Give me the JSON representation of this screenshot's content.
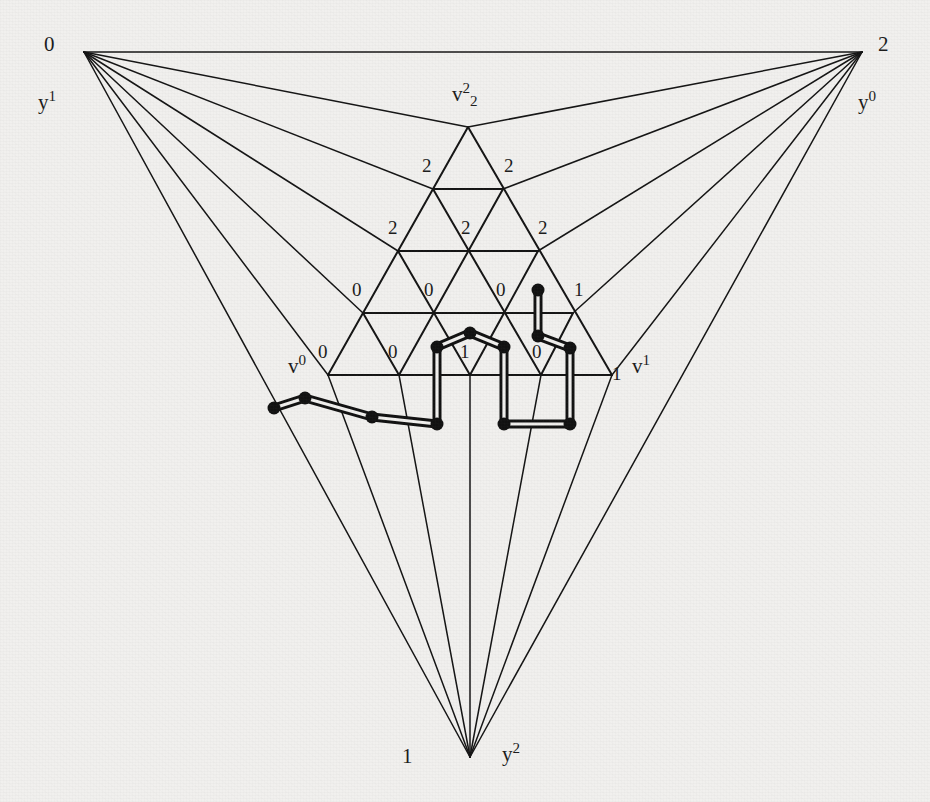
{
  "figure": {
    "background_color": "#f1f0ee",
    "ink_color": "#131313",
    "canvas": {
      "width": 930,
      "height": 802
    }
  },
  "outer_triangle": {
    "description": "Large outer triangle whose three corners fan out to the inner subdivided triangle",
    "corners": [
      {
        "id": "top-left",
        "label": "0",
        "name": "y",
        "name_sup": "1",
        "x": 84,
        "y": 52
      },
      {
        "id": "top-right",
        "label": "2",
        "name": "y",
        "name_sup": "0",
        "x": 862,
        "y": 52
      },
      {
        "id": "bottom",
        "label": "1",
        "name": "y",
        "name_sup": "2",
        "x": 470,
        "y": 757
      }
    ]
  },
  "inner_triangle": {
    "subdivision_level": 4,
    "apex": {
      "name": "v",
      "sup": "2",
      "sub": "2",
      "x": 468,
      "y": 127
    },
    "base_left": {
      "name": "v",
      "sup": "0",
      "x": 328,
      "y": 375
    },
    "base_right": {
      "name": "v",
      "sup": "1",
      "x": 612,
      "y": 375
    },
    "vertex_labels_by_row": [
      {
        "row": 0,
        "labels": [
          "2"
        ]
      },
      {
        "row": 1,
        "labels": [
          "2",
          "2"
        ]
      },
      {
        "row": 2,
        "labels": [
          "2",
          "2",
          "2"
        ]
      },
      {
        "row": 3,
        "labels": [
          "0",
          "0",
          "0",
          "1"
        ]
      },
      {
        "row": 4,
        "labels": [
          "0",
          "0",
          "1",
          "0",
          "1"
        ]
      }
    ]
  },
  "labels": {
    "corner_top_left": "0",
    "corner_top_right": "2",
    "corner_bottom": "1",
    "y1": "y",
    "y1_sup": "1",
    "y0": "y",
    "y0_sup": "0",
    "y2": "y",
    "y2_sup": "2",
    "v22": "v",
    "v22_sup": "2",
    "v22_sub": "2",
    "v0": "v",
    "v0_sup": "0",
    "v1": "v",
    "v1_sup": "1",
    "r1_a": "2",
    "r1_b": "2",
    "r2_a": "2",
    "r2_b": "2",
    "r2_c": "2",
    "r3_a": "0",
    "r3_b": "0",
    "r3_c": "0",
    "r3_d": "1",
    "r4_a": "0",
    "r4_b": "0",
    "r4_c": "1",
    "r4_d": "0",
    "r4_e": "1"
  },
  "path": {
    "description": "Thick doubled polyline with filled round nodes tracing a completely-labelled route through the subdivision",
    "node_count": 14,
    "nodes": [
      {
        "x": 274,
        "y": 408
      },
      {
        "x": 305,
        "y": 398
      },
      {
        "x": 372,
        "y": 417
      },
      {
        "x": 437,
        "y": 424
      },
      {
        "x": 437,
        "y": 347
      },
      {
        "x": 470,
        "y": 333
      },
      {
        "x": 504,
        "y": 347
      },
      {
        "x": 504,
        "y": 424
      },
      {
        "x": 570,
        "y": 424
      },
      {
        "x": 570,
        "y": 348
      },
      {
        "x": 538,
        "y": 336
      },
      {
        "x": 538,
        "y": 290
      }
    ]
  }
}
